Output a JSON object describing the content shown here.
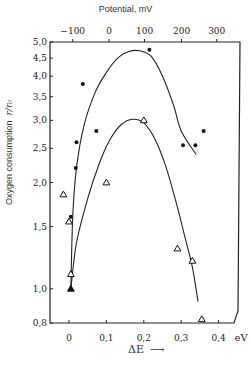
{
  "chart_data": {
    "type": "scatter",
    "title": "Potential, mV",
    "xlabel": "ΔE",
    "xunit": "eV",
    "ylabel": "Oxygen consumption",
    "ylabel_symbol": "r/r₀",
    "yscale": "log",
    "xlim": [
      -0.05,
      0.42
    ],
    "ylim": [
      0.8,
      5.0
    ],
    "x_ticks": [
      0,
      0.1,
      0.2,
      0.3,
      0.4
    ],
    "x_tick_labels": [
      "0",
      "0,1",
      "0,2",
      "0,3",
      "0,4"
    ],
    "top_ticks": [
      -100,
      0,
      100,
      200,
      300
    ],
    "top_tick_labels": [
      "−100",
      "0",
      "100",
      "200",
      "300"
    ],
    "top_tick_positions_eV": [
      0.01,
      0.107,
      0.202,
      0.301,
      0.395
    ],
    "y_ticks": [
      0.8,
      1.0,
      1.5,
      2.0,
      2.5,
      3.0,
      3.5,
      4.0,
      4.5,
      5.0
    ],
    "y_tick_labels": [
      "0,8",
      "1,0",
      "1,5",
      "2,0",
      "2,5",
      "3,0",
      "3,5",
      "4,0",
      "4,5",
      "5,0"
    ],
    "grid": false,
    "legend": null,
    "series": [
      {
        "name": "filled circles",
        "marker": "circle-filled",
        "points": [
          [
            0.005,
            1.6
          ],
          [
            0.018,
            2.2
          ],
          [
            0.02,
            2.6
          ],
          [
            0.037,
            3.8
          ],
          [
            0.073,
            2.8
          ],
          [
            0.215,
            4.75
          ],
          [
            0.305,
            2.55
          ],
          [
            0.338,
            2.55
          ],
          [
            0.36,
            2.8
          ]
        ]
      },
      {
        "name": "open triangles",
        "marker": "triangle-open",
        "points": [
          [
            -0.015,
            1.85
          ],
          [
            0.0,
            1.55
          ],
          [
            0.005,
            1.1
          ],
          [
            0.1,
            2.0
          ],
          [
            0.2,
            3.0
          ],
          [
            0.29,
            1.3
          ],
          [
            0.33,
            1.2
          ],
          [
            0.355,
            0.82
          ]
        ]
      },
      {
        "name": "filled triangle",
        "marker": "triangle-filled",
        "points": [
          [
            0.005,
            1.0
          ]
        ]
      }
    ],
    "curves": [
      {
        "name": "upper fit curve",
        "points": [
          [
            0.005,
            1.0
          ],
          [
            0.01,
            1.6
          ],
          [
            0.02,
            2.2
          ],
          [
            0.04,
            2.9
          ],
          [
            0.07,
            3.6
          ],
          [
            0.1,
            4.1
          ],
          [
            0.13,
            4.5
          ],
          [
            0.16,
            4.7
          ],
          [
            0.19,
            4.72
          ],
          [
            0.22,
            4.55
          ],
          [
            0.25,
            4.0
          ],
          [
            0.28,
            3.3
          ],
          [
            0.3,
            2.8
          ],
          [
            0.34,
            2.4
          ]
        ]
      },
      {
        "name": "lower fit curve",
        "points": [
          [
            0.005,
            1.0
          ],
          [
            0.02,
            1.35
          ],
          [
            0.05,
            1.8
          ],
          [
            0.08,
            2.25
          ],
          [
            0.11,
            2.65
          ],
          [
            0.14,
            2.92
          ],
          [
            0.17,
            3.02
          ],
          [
            0.2,
            2.95
          ],
          [
            0.23,
            2.65
          ],
          [
            0.26,
            2.2
          ],
          [
            0.29,
            1.7
          ],
          [
            0.31,
            1.4
          ],
          [
            0.33,
            1.15
          ],
          [
            0.345,
            0.92
          ]
        ]
      }
    ]
  },
  "labels": {
    "title": "Potential, mV",
    "ylabel": "Oxygen consumption",
    "ylabel_symbol": "r/r₀",
    "xlabel": "ΔE",
    "xlabel_arrow": "⟶",
    "xunit": "eV"
  }
}
